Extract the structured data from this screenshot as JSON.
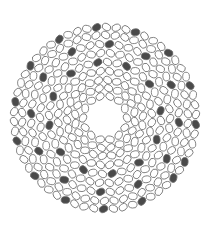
{
  "caption": {
    "text": "",
    "note": "clipped-illegible"
  },
  "diagram": {
    "type": "circular-strand-cross-section",
    "center": [
      105,
      118
    ],
    "hole_radius": 17,
    "ellipse": {
      "rx": 4.4,
      "ry": 3.4,
      "stroke": "#6e6e6e",
      "fill": "#ffffff",
      "dark_fill": "#4a4a4a"
    },
    "rings": [
      {
        "r": 22,
        "count": 14,
        "dark_every": 0,
        "phase": 0
      },
      {
        "r": 30,
        "count": 20,
        "dark_every": 0,
        "phase": 0.1
      },
      {
        "r": 38,
        "count": 26,
        "dark_every": 0,
        "phase": 0.05
      },
      {
        "r": 47,
        "count": 32,
        "dark_every": 0,
        "phase": 0.12
      },
      {
        "r": 56,
        "count": 36,
        "dark_every": 3,
        "phase": 0.2
      },
      {
        "r": 65,
        "count": 42,
        "dark_every": 0,
        "phase": 0.05
      },
      {
        "r": 74,
        "count": 48,
        "dark_every": 4,
        "phase": 0.33
      },
      {
        "r": 83,
        "count": 54,
        "dark_every": 0,
        "phase": 0.15
      },
      {
        "r": 91,
        "count": 58,
        "dark_every": 4,
        "phase": 0.0
      }
    ],
    "dark_count_visible": 40
  }
}
